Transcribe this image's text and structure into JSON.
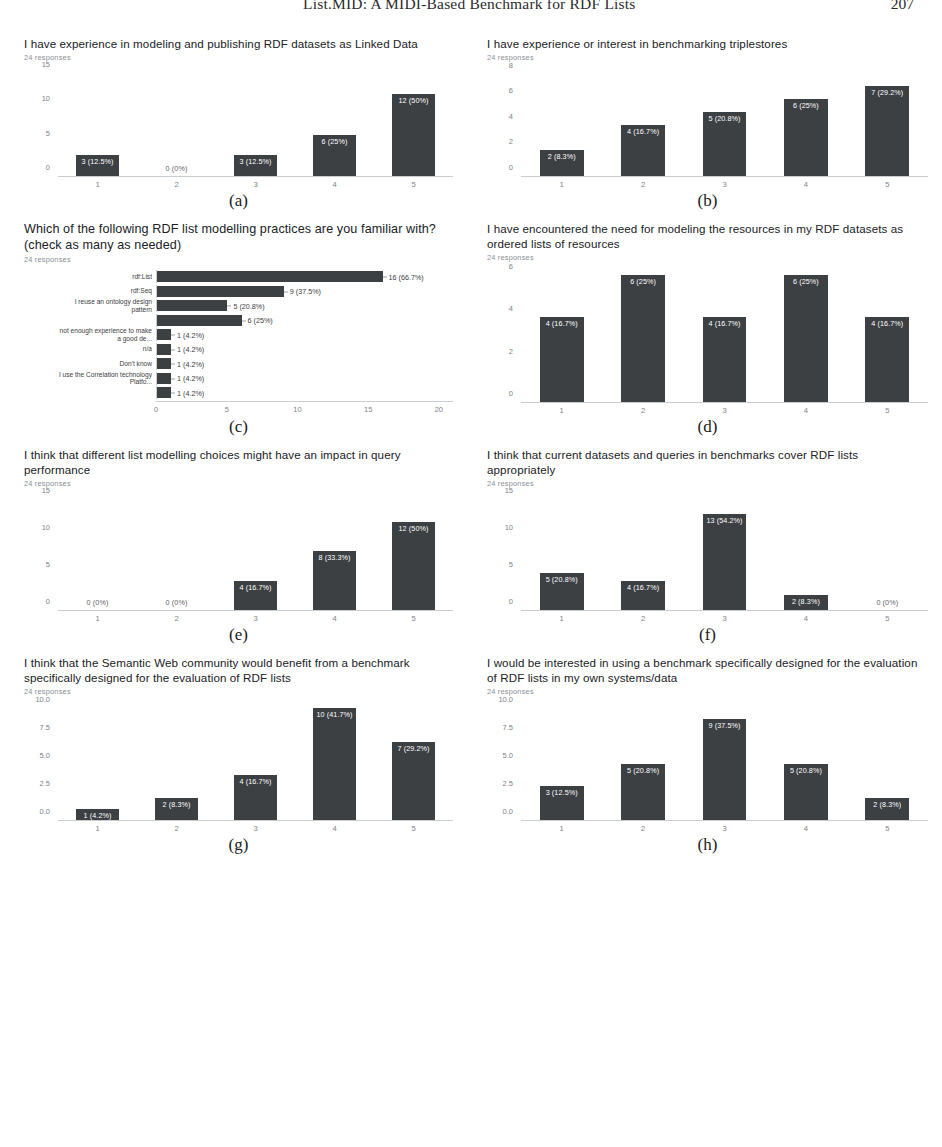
{
  "page_header": {
    "title": "List.MID: A MIDI-Based Benchmark for RDF Lists",
    "page_number": "207"
  },
  "responses_note": "24 responses",
  "subcaptions": {
    "a": "(a)",
    "b": "(b)",
    "c": "(c)",
    "d": "(d)",
    "e": "(e)",
    "f": "(f)",
    "g": "(g)",
    "h": "(h)"
  },
  "chart_data": [
    {
      "id": "a",
      "type": "bar",
      "orientation": "vertical",
      "title": "I have experience in modeling and publishing RDF datasets as Linked Data",
      "subtitle": "24 responses",
      "categories": [
        "1",
        "2",
        "3",
        "4",
        "5"
      ],
      "values": [
        3,
        0,
        3,
        6,
        12
      ],
      "data_labels": [
        "3 (12.5%)",
        "0 (0%)",
        "3 (12.5%)",
        "6 (25%)",
        "12 (50%)"
      ],
      "yticks": [
        0,
        5,
        10,
        15
      ],
      "ytick_labels": [
        "0",
        "5",
        "10",
        "15"
      ],
      "ylim": [
        0,
        16
      ],
      "xlabel": "",
      "ylabel": "",
      "grid": false,
      "legend": "none"
    },
    {
      "id": "b",
      "type": "bar",
      "orientation": "vertical",
      "title": "I have experience or interest in benchmarking triplestores",
      "subtitle": "24 responses",
      "categories": [
        "1",
        "2",
        "3",
        "4",
        "5"
      ],
      "values": [
        2,
        4,
        5,
        6,
        7
      ],
      "data_labels": [
        "2 (8.3%)",
        "4 (16.7%)",
        "5 (20.8%)",
        "6 (25%)",
        "7 (29.2%)"
      ],
      "yticks": [
        0,
        2,
        4,
        6,
        8
      ],
      "ytick_labels": [
        "0",
        "2",
        "4",
        "6",
        "8"
      ],
      "ylim": [
        0,
        8.6
      ],
      "xlabel": "",
      "ylabel": "",
      "grid": false,
      "legend": "none"
    },
    {
      "id": "c",
      "type": "bar",
      "orientation": "horizontal",
      "title": "Which of the following RDF list modelling practices are you familiar with? (check as many as needed)",
      "subtitle": "24 responses",
      "categories": [
        "rdf:List",
        "rdf:Seq",
        "I reuse an ontology design\npattern",
        "",
        "not enough experience to make\na good de...",
        "n/a",
        "Don't know",
        "I use the Correlation technology\nPlatfo...",
        ""
      ],
      "values": [
        16,
        9,
        5,
        6,
        1,
        1,
        1,
        1,
        1
      ],
      "data_labels": [
        "16 (66.7%)",
        "9 (37.5%)",
        "5 (20.8%)",
        "6 (25%)",
        "1 (4.2%)",
        "1 (4.2%)",
        "1 (4.2%)",
        "1 (4.2%)",
        "1 (4.2%)"
      ],
      "xticks": [
        0,
        5,
        10,
        15,
        20
      ],
      "xtick_labels": [
        "0",
        "5",
        "10",
        "15",
        "20"
      ],
      "xlim": [
        0,
        21
      ],
      "xlabel": "",
      "ylabel": "",
      "grid": false,
      "legend": "none"
    },
    {
      "id": "d",
      "type": "bar",
      "orientation": "vertical",
      "title": "I have encountered the need for modeling the resources in my RDF datasets as ordered lists of resources",
      "subtitle": "24 responses",
      "categories": [
        "1",
        "2",
        "3",
        "4",
        "5"
      ],
      "values": [
        4,
        6,
        4,
        6,
        4
      ],
      "data_labels": [
        "4 (16.7%)",
        "6 (25%)",
        "4 (16.7%)",
        "6 (25%)",
        "4 (16.7%)"
      ],
      "yticks": [
        0,
        2,
        4,
        6
      ],
      "ytick_labels": [
        "0",
        "2",
        "4",
        "6"
      ],
      "ylim": [
        0,
        6.4
      ],
      "xlabel": "",
      "ylabel": "",
      "grid": false,
      "legend": "none"
    },
    {
      "id": "e",
      "type": "bar",
      "orientation": "vertical",
      "title": "I think that different list modelling choices might have an impact in query performance",
      "subtitle": "24 responses",
      "categories": [
        "1",
        "2",
        "3",
        "4",
        "5"
      ],
      "values": [
        0,
        0,
        4,
        8,
        12
      ],
      "data_labels": [
        "0 (0%)",
        "0 (0%)",
        "4 (16.7%)",
        "8 (33.3%)",
        "12 (50%)"
      ],
      "yticks": [
        0,
        5,
        10,
        15
      ],
      "ytick_labels": [
        "0",
        "5",
        "10",
        "15"
      ],
      "ylim": [
        0,
        16
      ],
      "xlabel": "",
      "ylabel": "",
      "grid": false,
      "legend": "none"
    },
    {
      "id": "f",
      "type": "bar",
      "orientation": "vertical",
      "title": "I think that current datasets and queries in benchmarks cover RDF lists appropriately",
      "subtitle": "24 responses",
      "categories": [
        "1",
        "2",
        "3",
        "4",
        "5"
      ],
      "values": [
        5,
        4,
        13,
        2,
        0
      ],
      "data_labels": [
        "5 (20.8%)",
        "4 (16.7%)",
        "13 (54.2%)",
        "2 (8.3%)",
        "0 (0%)"
      ],
      "yticks": [
        0,
        5,
        10,
        15
      ],
      "ytick_labels": [
        "0",
        "5",
        "10",
        "15"
      ],
      "ylim": [
        0,
        16
      ],
      "xlabel": "",
      "ylabel": "",
      "grid": false,
      "legend": "none"
    },
    {
      "id": "g",
      "type": "bar",
      "orientation": "vertical",
      "title": "I think that the Semantic Web community would benefit from a benchmark specifically designed for the evaluation of RDF lists",
      "subtitle": "24 responses",
      "categories": [
        "1",
        "2",
        "3",
        "4",
        "5"
      ],
      "values": [
        1,
        2,
        4,
        10,
        7
      ],
      "data_labels": [
        "1 (4.2%)",
        "2 (8.3%)",
        "4 (16.7%)",
        "10 (41.7%)",
        "7 (29.2%)"
      ],
      "yticks": [
        0,
        2.5,
        5,
        7.5,
        10
      ],
      "ytick_labels": [
        "0.0",
        "2.5",
        "5.0",
        "7.5",
        "10.0"
      ],
      "ylim": [
        0,
        10.7
      ],
      "xlabel": "",
      "ylabel": "",
      "grid": false,
      "legend": "none"
    },
    {
      "id": "h",
      "type": "bar",
      "orientation": "vertical",
      "title": "I would be interested in using a benchmark specifically designed for the evaluation of RDF lists in my own systems/data",
      "subtitle": "24 responses",
      "categories": [
        "1",
        "2",
        "3",
        "4",
        "5"
      ],
      "values": [
        3,
        5,
        9,
        5,
        2
      ],
      "data_labels": [
        "3 (12.5%)",
        "5 (20.8%)",
        "9 (37.5%)",
        "5 (20.8%)",
        "2 (8.3%)"
      ],
      "yticks": [
        0,
        2.5,
        5,
        7.5,
        10
      ],
      "ytick_labels": [
        "0.0",
        "2.5",
        "5.0",
        "7.5",
        "10.0"
      ],
      "ylim": [
        0,
        10.7
      ],
      "xlabel": "",
      "ylabel": "",
      "grid": false,
      "legend": "none"
    }
  ],
  "colors": {
    "bar": "#3c4043",
    "axis": "#c9cdd1",
    "tick_text": "#7d8288",
    "title_text": "#202124",
    "subtitle_text": "#8a8f95",
    "bar_value_text": "#ffffff"
  }
}
